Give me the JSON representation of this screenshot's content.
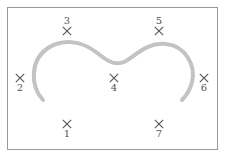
{
  "diagram": {
    "frame": {
      "x": 7,
      "y": 7,
      "width": 211,
      "height": 143,
      "border_color": "#9a9a9a"
    },
    "curve": {
      "color": "#c3c3c3",
      "stroke_width": 4,
      "description": "gray M-shaped curve with two lobes",
      "path": "M 43 100 C 30 86, 30 60, 48 48 C 62 39, 80 40, 96 52 C 106 60, 114 66, 124 62 C 136 56, 146 42, 166 44 C 186 46, 196 66, 192 82 C 190 90, 186 96, 182 100"
    },
    "markers_color": "#555555",
    "markers": [
      {
        "id": "1",
        "label": "1",
        "x": 67,
        "y": 124,
        "label_pos": "below"
      },
      {
        "id": "2",
        "label": "2",
        "x": 20,
        "y": 78,
        "label_pos": "below"
      },
      {
        "id": "3",
        "label": "3",
        "x": 67,
        "y": 31,
        "label_pos": "above"
      },
      {
        "id": "4",
        "label": "4",
        "x": 114,
        "y": 78,
        "label_pos": "below"
      },
      {
        "id": "5",
        "label": "5",
        "x": 159,
        "y": 31,
        "label_pos": "above"
      },
      {
        "id": "6",
        "label": "6",
        "x": 204,
        "y": 78,
        "label_pos": "below"
      },
      {
        "id": "7",
        "label": "7",
        "x": 159,
        "y": 124,
        "label_pos": "below"
      }
    ]
  }
}
